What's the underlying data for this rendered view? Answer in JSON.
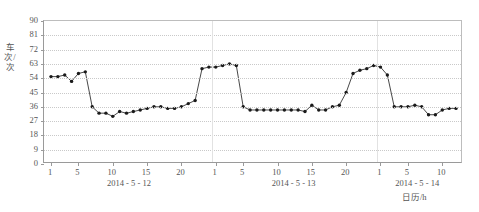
{
  "chart_data": {
    "type": "line",
    "title": "",
    "xlabel": "日历/h",
    "ylabel": "车次/次",
    "ylim": [
      0,
      90
    ],
    "yticks": [
      0,
      9,
      18,
      27,
      36,
      45,
      54,
      63,
      72,
      81,
      90
    ],
    "grid": true,
    "legend": "none",
    "marker": "filled-circle",
    "line_color": "#333333",
    "marker_color": "#1a1a1a",
    "grid_color": "#c9c9c9",
    "axis_color": "#9a9a9a",
    "x_axis_kind": "hour-of-day across three dates",
    "day_groups": [
      {
        "date": "2014 - 5 - 12",
        "tick_hours": [
          1,
          5,
          10,
          15,
          20
        ],
        "tick_labels": [
          "1",
          "5",
          "10",
          "15",
          "20"
        ]
      },
      {
        "date": "2014 - 5 - 13",
        "tick_hours": [
          1,
          5,
          10,
          15,
          20
        ],
        "tick_labels": [
          "1",
          "5",
          "10",
          "15",
          "20"
        ]
      },
      {
        "date": "2014 - 5 - 14",
        "tick_hours": [
          1,
          5,
          10
        ],
        "tick_labels": [
          "1",
          "5",
          "10"
        ]
      }
    ],
    "x": [
      "5-12 1",
      "5-12 2",
      "5-12 3",
      "5-12 4",
      "5-12 5",
      "5-12 6",
      "5-12 7",
      "5-12 8",
      "5-12 9",
      "5-12 10",
      "5-12 11",
      "5-12 12",
      "5-12 13",
      "5-12 14",
      "5-12 15",
      "5-12 16",
      "5-12 17",
      "5-12 18",
      "5-12 19",
      "5-12 20",
      "5-12 21",
      "5-12 22",
      "5-12 23",
      "5-12 24",
      "5-13 1",
      "5-13 2",
      "5-13 3",
      "5-13 4",
      "5-13 5",
      "5-13 6",
      "5-13 7",
      "5-13 8",
      "5-13 9",
      "5-13 10",
      "5-13 11",
      "5-13 12",
      "5-13 13",
      "5-13 14",
      "5-13 15",
      "5-13 16",
      "5-13 17",
      "5-13 18",
      "5-13 19",
      "5-13 20",
      "5-13 21",
      "5-13 22",
      "5-13 23",
      "5-13 24",
      "5-14 1",
      "5-14 2",
      "5-14 3",
      "5-14 4",
      "5-14 5",
      "5-14 6",
      "5-14 7",
      "5-14 8",
      "5-14 9",
      "5-14 10",
      "5-14 11",
      "5-14 12"
    ],
    "values": [
      55,
      55,
      56,
      52,
      57,
      58,
      36,
      32,
      32,
      30,
      33,
      32,
      33,
      34,
      35,
      36,
      36,
      35,
      35,
      36,
      38,
      40,
      60,
      61,
      61,
      62,
      63,
      62,
      36,
      34,
      34,
      34,
      34,
      34,
      34,
      34,
      34,
      33,
      37,
      34,
      34,
      36,
      37,
      45,
      57,
      59,
      60,
      62,
      61,
      56,
      36,
      36,
      36,
      37,
      36,
      31,
      31,
      34,
      35,
      35
    ],
    "series_name": "车次"
  },
  "axis": {
    "y_tick_labels": [
      "0",
      "9",
      "18",
      "27",
      "36",
      "45",
      "54",
      "63",
      "72",
      "81",
      "90"
    ],
    "y_title": "车次/次",
    "x_title": "日历/h"
  }
}
